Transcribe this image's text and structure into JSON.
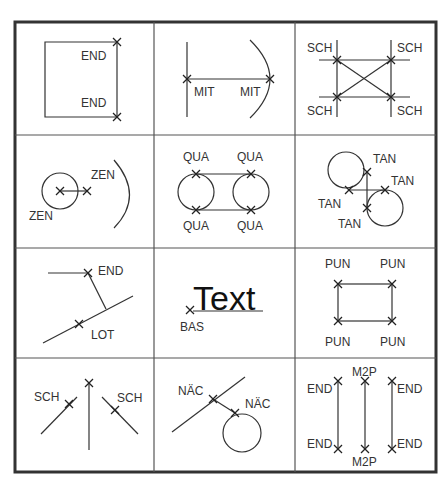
{
  "diagram": {
    "cells": [
      {
        "name": "endpoint",
        "labels": [
          "END",
          "END"
        ]
      },
      {
        "name": "midpoint",
        "labels": [
          "MIT",
          "MIT"
        ]
      },
      {
        "name": "intersection",
        "labels": [
          "SCH",
          "SCH",
          "SCH",
          "SCH"
        ]
      },
      {
        "name": "center",
        "labels": [
          "ZEN",
          "ZEN"
        ]
      },
      {
        "name": "quadrant",
        "labels": [
          "QUA",
          "QUA",
          "QUA",
          "QUA"
        ]
      },
      {
        "name": "tangent",
        "labels": [
          "TAN",
          "TAN",
          "TAN",
          "TAN"
        ]
      },
      {
        "name": "perpendicular",
        "labels": [
          "END",
          "LOT"
        ]
      },
      {
        "name": "insertion",
        "labels": [
          "Text",
          "BAS"
        ]
      },
      {
        "name": "node",
        "labels": [
          "PUN",
          "PUN",
          "PUN",
          "PUN"
        ]
      },
      {
        "name": "apparent-intersection",
        "labels": [
          "SCH",
          "SCH"
        ]
      },
      {
        "name": "nearest",
        "labels": [
          "NÄC",
          "NÄC"
        ]
      },
      {
        "name": "endpoint-midpoint",
        "labels": [
          "END",
          "M2P",
          "END",
          "END",
          "M2P",
          "END"
        ]
      }
    ]
  }
}
